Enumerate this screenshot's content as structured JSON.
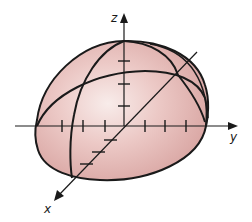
{
  "figure": {
    "title": "",
    "shape": "ellipsoid",
    "fill_color": "#e2b3b0",
    "highlight_color": "#f6e6e4",
    "stroke_color": "#1a1a1a",
    "axes": {
      "x": {
        "label": "x",
        "ticks": 3
      },
      "y": {
        "label": "y",
        "ticks": 6
      },
      "z": {
        "label": "z",
        "ticks": 3
      }
    }
  }
}
